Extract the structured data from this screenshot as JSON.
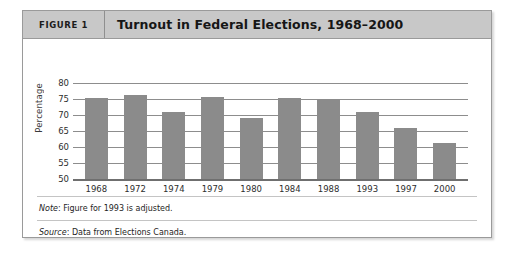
{
  "figure": {
    "number_label": "FIGURE 1",
    "title": "Turnout in Federal Elections, 1968–2000"
  },
  "notes": {
    "note_label": "Note",
    "note_text": ": Figure for 1993 is adjusted.",
    "source_label": "Source",
    "source_text": ": Data from Elections Canada."
  },
  "colors": {
    "bar": "#8b8b8b",
    "header_background": "#c8c8c8",
    "frame_border": "#9a9a9a",
    "gridline": "#8d8d8d"
  },
  "chart_data": {
    "type": "bar",
    "title": "Turnout in Federal Elections, 1968–2000",
    "xlabel": "",
    "ylabel": "Percentage",
    "ylim": [
      50,
      80
    ],
    "yticks": [
      80,
      75,
      70,
      65,
      60,
      55,
      50
    ],
    "grid": true,
    "legend": "none",
    "categories": [
      "1968",
      "1972",
      "1974",
      "1979",
      "1980",
      "1984",
      "1988",
      "1993",
      "1997",
      "2000"
    ],
    "values": [
      75.3,
      76.1,
      71.0,
      75.7,
      69.0,
      75.3,
      75.0,
      71.0,
      66.0,
      61.2
    ]
  }
}
